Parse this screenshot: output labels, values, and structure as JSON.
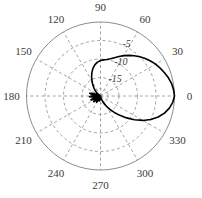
{
  "figure": {
    "type": "polar-radiation-pattern",
    "background_color": "#ffffff",
    "grid_color": "#8c8c8c",
    "curve_color": "#000000"
  },
  "chart_data": {
    "type": "line",
    "projection": "polar",
    "title": "",
    "xlabel": "",
    "ylabel": "",
    "units": "dB",
    "rlim": [
      -20,
      0
    ],
    "r_ticks": [
      -5,
      -10,
      -15
    ],
    "r_tick_labels": [
      "-5",
      "-10",
      "-15"
    ],
    "outer_ring_label": "0",
    "theta_direction": "counterclockwise",
    "theta_zero_location": "E",
    "theta_ticks": [
      0,
      30,
      60,
      90,
      120,
      150,
      180,
      210,
      240,
      270,
      300,
      330
    ],
    "theta_tick_labels": [
      "0",
      "30",
      "60",
      "90",
      "120",
      "150",
      "180",
      "210",
      "240",
      "270",
      "300",
      "330"
    ],
    "grid": true,
    "grid_style": "dashed",
    "legend": null,
    "series": [
      {
        "name": "pattern",
        "theta": [
          0,
          5,
          10,
          15,
          20,
          25,
          30,
          35,
          40,
          45,
          50,
          55,
          60,
          65,
          70,
          75,
          80,
          85,
          90,
          95,
          100,
          105,
          110,
          115,
          120,
          125,
          130,
          135,
          140,
          145,
          150,
          155,
          160,
          163,
          166,
          169,
          172,
          175,
          178,
          181,
          184,
          187,
          190,
          193,
          196,
          199,
          202,
          205,
          208,
          211,
          214,
          217,
          220,
          223,
          226,
          229,
          232,
          235,
          238,
          241,
          244,
          247,
          250,
          253,
          256,
          259,
          262,
          265,
          268,
          271,
          274,
          277,
          280,
          283,
          286,
          289,
          292,
          295,
          300,
          305,
          310,
          315,
          320,
          325,
          330,
          335,
          340,
          345,
          350,
          355,
          360
        ],
        "r_db": [
          0,
          -0.2,
          -0.5,
          -1.0,
          -1.6,
          -2.2,
          -2.8,
          -3.5,
          -4.2,
          -5.0,
          -5.8,
          -6.6,
          -7.4,
          -8.2,
          -9.0,
          -9.6,
          -10.0,
          -10.2,
          -10.4,
          -10.8,
          -11.4,
          -12.2,
          -13.2,
          -14.3,
          -15.4,
          -16.4,
          -17.3,
          -18.1,
          -18.8,
          -19.4,
          -19.8,
          -19.4,
          -18.4,
          -17.6,
          -17.0,
          -17.6,
          -18.8,
          -19.6,
          -18.6,
          -17.4,
          -17.0,
          -17.8,
          -19.2,
          -19.8,
          -19.0,
          -17.8,
          -17.2,
          -17.6,
          -18.8,
          -19.8,
          -19.0,
          -18.0,
          -17.6,
          -18.2,
          -19.4,
          -19.9,
          -19.2,
          -18.4,
          -18.0,
          -18.6,
          -19.5,
          -20.0,
          -19.6,
          -19.0,
          -18.6,
          -19.0,
          -19.6,
          -20.0,
          -19.7,
          -19.3,
          -19.0,
          -19.2,
          -19.6,
          -19.9,
          -19.5,
          -19.0,
          -18.4,
          -17.8,
          -16.8,
          -15.6,
          -14.2,
          -12.6,
          -10.8,
          -8.8,
          -6.8,
          -5.0,
          -3.4,
          -2.1,
          -1.1,
          -0.4,
          0
        ]
      }
    ],
    "main_lobe": {
      "direction_deg": 0,
      "peak_db": 0,
      "beamwidth_3db_deg": 80
    },
    "back_lobes": {
      "region_deg": [
        150,
        290
      ],
      "typical_level_db": -18
    }
  },
  "angular_labels": [
    {
      "text": "0",
      "deg": 0
    },
    {
      "text": "30",
      "deg": 30
    },
    {
      "text": "60",
      "deg": 60
    },
    {
      "text": "90",
      "deg": 90
    },
    {
      "text": "120",
      "deg": 120
    },
    {
      "text": "150",
      "deg": 150
    },
    {
      "text": "180",
      "deg": 180
    },
    {
      "text": "210",
      "deg": 210
    },
    {
      "text": "240",
      "deg": 240
    },
    {
      "text": "270",
      "deg": 270
    },
    {
      "text": "300",
      "deg": 300
    },
    {
      "text": "330",
      "deg": 330
    }
  ],
  "radial_labels": [
    {
      "text": "-5",
      "value": -5
    },
    {
      "text": "-10",
      "value": -10
    },
    {
      "text": "-15",
      "value": -15
    }
  ]
}
